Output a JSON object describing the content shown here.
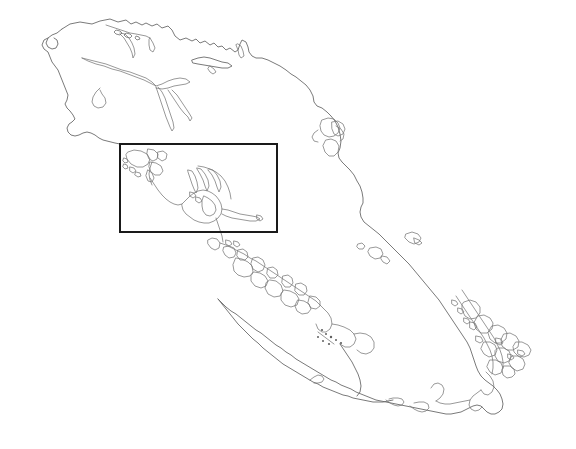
{
  "figure": {
    "kind": "map",
    "title": "",
    "subtitle": "",
    "caption": "",
    "background_color": "#ffffff",
    "coastline_color": "#6b6b6b",
    "inset_box_color": "#1a1a1a",
    "width_px": 576,
    "height_px": 449,
    "labels": [],
    "legend": [],
    "scale_bar": "",
    "north_arrow": "",
    "axis_ticks": []
  },
  "inset_box": {
    "name": "study-area-inset",
    "label": "",
    "x": 120,
    "y": 144,
    "width": 157,
    "height": 88,
    "stroke_color": "#1a1a1a",
    "stroke_width_px": 1.7
  },
  "layers": [
    {
      "name": "main-island-outline",
      "type": "coastline",
      "stroke": "#6b6b6b",
      "description": "large elongated island, NW to SE orientation"
    },
    {
      "name": "inner-inlets",
      "type": "coastline",
      "stroke": "#777777",
      "description": "fjords and narrow inlets in the northwest interior"
    },
    {
      "name": "archipelago-west",
      "type": "coastline",
      "stroke": "#6b6b6b",
      "description": "cluster of small islands along the west-central coast"
    },
    {
      "name": "archipelago-southeast",
      "type": "coastline",
      "stroke": "#6b6b6b",
      "description": "dense chain of small islands along the southeast coast"
    },
    {
      "name": "offshore-islets",
      "type": "coastline",
      "stroke": "#6f6f6f",
      "description": "isolated small offshore islets and rocks"
    }
  ]
}
